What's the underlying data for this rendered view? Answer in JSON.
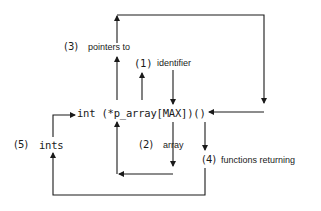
{
  "diagram": {
    "declaration": "int (*p_array[MAX])()",
    "steps": [
      {
        "num": "(1)",
        "text": "identifier"
      },
      {
        "num": "(2)",
        "text": "array"
      },
      {
        "num": "(3)",
        "text": "pointers to"
      },
      {
        "num": "(4)",
        "text": "functions returning"
      },
      {
        "num": "(5)",
        "text": "ints"
      }
    ],
    "colors": {
      "ink": "#1a1a1a",
      "background": "#ffffff"
    }
  }
}
